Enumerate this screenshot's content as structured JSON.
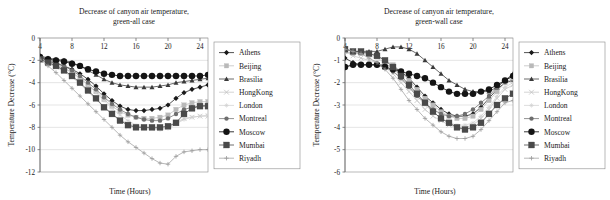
{
  "figure": {
    "background": "#ffffff",
    "text_color": "#1b1b1b",
    "grid_color": "#c9c9c9",
    "frame_color": "#8a8a8a"
  },
  "series_style": [
    {
      "name": "Athens",
      "color": "#1a1a1a",
      "marker": "diamond",
      "marker_size": 2.6,
      "line_width": 0.75
    },
    {
      "name": "Beijing",
      "color": "#b9b9b9",
      "marker": "square",
      "marker_size": 2.2,
      "line_width": 0.7
    },
    {
      "name": "Brasilia",
      "color": "#3a3a3a",
      "marker": "triangle",
      "marker_size": 2.5,
      "line_width": 0.75
    },
    {
      "name": "HongKong",
      "color": "#c2c2c2",
      "marker": "cross",
      "marker_size": 2.4,
      "line_width": 0.7
    },
    {
      "name": "London",
      "color": "#d0d0d0",
      "marker": "star",
      "marker_size": 2.2,
      "line_width": 0.7
    },
    {
      "name": "Montreal",
      "color": "#6e6e6e",
      "marker": "circle",
      "marker_size": 2.2,
      "line_width": 0.75
    },
    {
      "name": "Moscow",
      "color": "#141414",
      "marker": "circle",
      "marker_size": 3.2,
      "line_width": 0.85
    },
    {
      "name": "Mumbai",
      "color": "#4a4a4a",
      "marker": "square",
      "marker_size": 3.0,
      "line_width": 0.8
    },
    {
      "name": "Riyadh",
      "color": "#9a9a9a",
      "marker": "plus",
      "marker_size": 2.2,
      "line_width": 0.7
    }
  ],
  "chart_data": [
    {
      "id": "green-all",
      "type": "line",
      "title": "Decrease of canyon air temperature,",
      "subtitle": "green-all case",
      "xlabel": "Time (Hours)",
      "ylabel": "Temperature Decrease (°C)",
      "xlim": [
        4,
        25
      ],
      "ylim": [
        -12,
        0
      ],
      "xticks": [
        4,
        8,
        12,
        16,
        20,
        24
      ],
      "yticks": [
        0,
        -2,
        -4,
        -6,
        -8,
        -10,
        -12
      ],
      "ytick_labels": [
        "0",
        "-2",
        "-4",
        "-6",
        "-8",
        "-10",
        "-12"
      ],
      "grid": true,
      "legend_position": "right",
      "x": [
        4,
        5,
        6,
        7,
        8,
        9,
        10,
        11,
        12,
        13,
        14,
        15,
        16,
        17,
        18,
        19,
        20,
        21,
        22,
        23,
        24,
        25
      ],
      "series": [
        {
          "name": "Athens",
          "values": [
            -1.7,
            -2.1,
            -2.3,
            -2.5,
            -2.8,
            -3.2,
            -3.7,
            -4.3,
            -5.0,
            -5.6,
            -6.1,
            -6.4,
            -6.5,
            -6.5,
            -6.4,
            -6.3,
            -6.0,
            -5.4,
            -4.9,
            -4.6,
            -4.4,
            -4.2
          ]
        },
        {
          "name": "Beijing",
          "values": [
            -1.9,
            -2.2,
            -2.4,
            -2.7,
            -3.1,
            -3.6,
            -4.2,
            -4.8,
            -5.5,
            -6.1,
            -6.6,
            -6.9,
            -7.1,
            -7.2,
            -7.2,
            -7.1,
            -6.9,
            -6.4,
            -6.0,
            -5.8,
            -5.7,
            -5.7
          ]
        },
        {
          "name": "Brasilia",
          "values": [
            -1.6,
            -1.8,
            -1.9,
            -2.0,
            -2.2,
            -2.5,
            -2.9,
            -3.3,
            -3.7,
            -4.0,
            -4.2,
            -4.3,
            -4.4,
            -4.4,
            -4.4,
            -4.3,
            -4.2,
            -4.0,
            -3.9,
            -3.8,
            -3.7,
            -3.6
          ]
        },
        {
          "name": "HongKong",
          "values": [
            -1.9,
            -2.3,
            -2.6,
            -3.0,
            -3.5,
            -4.1,
            -4.8,
            -5.5,
            -6.2,
            -6.8,
            -7.3,
            -7.7,
            -7.9,
            -8.0,
            -8.1,
            -8.1,
            -8.0,
            -7.6,
            -7.2,
            -7.1,
            -7.0,
            -7.0
          ]
        },
        {
          "name": "London",
          "values": [
            -1.8,
            -2.1,
            -2.4,
            -2.7,
            -3.1,
            -3.6,
            -4.2,
            -4.9,
            -5.6,
            -6.3,
            -6.9,
            -7.4,
            -7.8,
            -8.0,
            -8.1,
            -8.2,
            -8.1,
            -7.7,
            -7.3,
            -7.1,
            -7.0,
            -6.9
          ]
        },
        {
          "name": "Montreal",
          "values": [
            -1.8,
            -2.0,
            -2.2,
            -2.5,
            -2.9,
            -3.4,
            -4.0,
            -4.6,
            -5.3,
            -5.9,
            -6.4,
            -6.8,
            -7.1,
            -7.3,
            -7.4,
            -7.4,
            -7.2,
            -6.8,
            -6.4,
            -6.2,
            -6.1,
            -6.0
          ]
        },
        {
          "name": "Moscow",
          "values": [
            -1.7,
            -1.9,
            -2.0,
            -2.1,
            -2.3,
            -2.5,
            -2.8,
            -3.0,
            -3.2,
            -3.3,
            -3.4,
            -3.4,
            -3.4,
            -3.4,
            -3.4,
            -3.4,
            -3.4,
            -3.4,
            -3.4,
            -3.4,
            -3.4,
            -3.3
          ]
        },
        {
          "name": "Mumbai",
          "values": [
            -1.9,
            -2.2,
            -2.5,
            -2.9,
            -3.4,
            -4.0,
            -4.7,
            -5.4,
            -6.2,
            -6.8,
            -7.4,
            -7.8,
            -8.0,
            -8.0,
            -8.0,
            -8.0,
            -7.9,
            -7.6,
            -6.8,
            -6.3,
            -6.1,
            -6.1
          ]
        },
        {
          "name": "Riyadh",
          "values": [
            -1.9,
            -2.5,
            -3.1,
            -3.8,
            -4.5,
            -5.2,
            -5.9,
            -6.6,
            -7.3,
            -8.0,
            -8.7,
            -9.3,
            -9.8,
            -10.3,
            -10.8,
            -11.2,
            -11.3,
            -10.6,
            -10.2,
            -10.1,
            -10.0,
            -10.0
          ]
        }
      ]
    },
    {
      "id": "green-wall",
      "type": "line",
      "title": "Decrease of canyon air temperature,",
      "subtitle": "green-wall case",
      "xlabel": "Time (Hours)",
      "ylabel": "Temperature Decrease (°C)",
      "xlim": [
        4,
        25
      ],
      "ylim": [
        -6,
        0
      ],
      "xticks": [
        4,
        8,
        12,
        16,
        20,
        24
      ],
      "yticks": [
        0,
        -1,
        -2,
        -3,
        -4,
        -5,
        -6
      ],
      "ytick_labels": [
        "0",
        "-1",
        "-2",
        "-3",
        "-4",
        "-5",
        "-6"
      ],
      "grid": true,
      "legend_position": "right",
      "x": [
        4,
        5,
        6,
        7,
        8,
        9,
        10,
        11,
        12,
        13,
        14,
        15,
        16,
        17,
        18,
        19,
        20,
        21,
        22,
        23,
        24,
        25
      ],
      "series": [
        {
          "name": "Athens",
          "values": [
            -0.9,
            -1.1,
            -1.2,
            -1.2,
            -1.2,
            -1.2,
            -1.3,
            -1.5,
            -1.8,
            -2.2,
            -2.6,
            -2.9,
            -3.2,
            -3.4,
            -3.5,
            -3.5,
            -3.4,
            -3.1,
            -2.7,
            -2.3,
            -2.0,
            -1.9
          ]
        },
        {
          "name": "Beijing",
          "values": [
            -0.6,
            -0.7,
            -0.7,
            -0.7,
            -0.8,
            -1.0,
            -1.2,
            -1.5,
            -1.9,
            -2.3,
            -2.7,
            -3.0,
            -3.3,
            -3.5,
            -3.6,
            -3.6,
            -3.5,
            -3.2,
            -2.8,
            -2.4,
            -2.0,
            -1.8
          ]
        },
        {
          "name": "Brasilia",
          "values": [
            -0.5,
            -0.6,
            -0.6,
            -0.6,
            -0.6,
            -0.5,
            -0.4,
            -0.4,
            -0.5,
            -0.7,
            -1.0,
            -1.3,
            -1.6,
            -1.9,
            -2.1,
            -2.3,
            -2.4,
            -2.4,
            -2.4,
            -2.2,
            -1.9,
            -1.6
          ]
        },
        {
          "name": "HongKong",
          "values": [
            -0.6,
            -0.8,
            -0.9,
            -1.0,
            -1.1,
            -1.3,
            -1.6,
            -2.0,
            -2.4,
            -2.8,
            -3.2,
            -3.5,
            -3.7,
            -3.9,
            -4.0,
            -4.0,
            -3.9,
            -3.6,
            -3.2,
            -2.7,
            -2.3,
            -2.1
          ]
        },
        {
          "name": "London",
          "values": [
            -0.5,
            -0.6,
            -0.7,
            -0.8,
            -0.9,
            -1.1,
            -1.4,
            -1.8,
            -2.2,
            -2.6,
            -3.0,
            -3.3,
            -3.6,
            -3.8,
            -3.9,
            -3.9,
            -3.8,
            -3.5,
            -3.1,
            -2.6,
            -2.2,
            -2.0
          ]
        },
        {
          "name": "Montreal",
          "values": [
            -1.3,
            -1.2,
            -1.2,
            -1.2,
            -1.2,
            -1.3,
            -1.5,
            -1.8,
            -2.2,
            -2.6,
            -2.9,
            -3.2,
            -3.4,
            -3.5,
            -3.5,
            -3.4,
            -3.2,
            -2.9,
            -2.6,
            -2.2,
            -1.9,
            -1.7
          ]
        },
        {
          "name": "Moscow",
          "values": [
            -1.3,
            -1.2,
            -1.2,
            -1.2,
            -1.2,
            -1.3,
            -1.4,
            -1.5,
            -1.6,
            -1.7,
            -1.8,
            -2.0,
            -2.2,
            -2.4,
            -2.5,
            -2.5,
            -2.5,
            -2.4,
            -2.3,
            -2.1,
            -1.9,
            -1.7
          ]
        },
        {
          "name": "Mumbai",
          "values": [
            -0.5,
            -0.6,
            -0.6,
            -0.7,
            -0.8,
            -1.0,
            -1.3,
            -1.7,
            -2.1,
            -2.5,
            -2.9,
            -3.3,
            -3.6,
            -3.8,
            -4.0,
            -4.1,
            -4.0,
            -3.8,
            -3.4,
            -3.0,
            -2.7,
            -2.5
          ]
        },
        {
          "name": "Riyadh",
          "values": [
            -0.5,
            -0.6,
            -0.7,
            -0.9,
            -1.1,
            -1.4,
            -1.8,
            -2.3,
            -2.8,
            -3.2,
            -3.6,
            -3.9,
            -4.2,
            -4.4,
            -4.5,
            -4.5,
            -4.4,
            -4.1,
            -3.7,
            -3.3,
            -2.9,
            -2.8
          ]
        }
      ]
    }
  ],
  "legend": {
    "items": [
      "Athens",
      "Beijing",
      "Brasilia",
      "HongKong",
      "London",
      "Montreal",
      "Moscow",
      "Mumbai",
      "Riyadh"
    ]
  }
}
